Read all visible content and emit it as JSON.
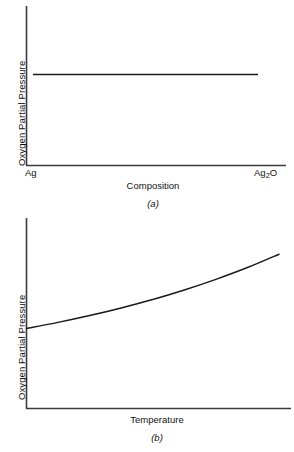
{
  "figure": {
    "panels": [
      {
        "id": "a",
        "caption": "(a)",
        "ylabel": "Oxygen Partial Pressure",
        "xlabel": "Composition",
        "xtick_left": "Ag",
        "xtick_right_main": "Ag",
        "xtick_right_sub": "2",
        "xtick_right_tail": "O"
      },
      {
        "id": "b",
        "caption": "(b)",
        "ylabel": "Oxygen Partial Pressure",
        "xlabel": "Temperature",
        "xtick_left": "",
        "xtick_right_main": "",
        "xtick_right_sub": "",
        "xtick_right_tail": ""
      }
    ]
  },
  "chart_data": [
    {
      "type": "line",
      "panel": "a",
      "title": "",
      "xlabel": "Composition",
      "ylabel": "Oxygen Partial Pressure",
      "xtick_labels": [
        "Ag",
        "Ag2O"
      ],
      "ytick_labels": [],
      "grid": false,
      "legend": "none",
      "xlim": [
        0,
        1
      ],
      "ylim": [
        0,
        1
      ],
      "x": [
        0.03,
        0.15,
        0.3,
        0.45,
        0.6,
        0.75,
        0.9,
        1.0
      ],
      "y": [
        0.575,
        0.575,
        0.575,
        0.575,
        0.575,
        0.575,
        0.575,
        0.575
      ],
      "series": [
        {
          "name": "Oxygen partial pressure vs composition",
          "x": [
            0.03,
            0.15,
            0.3,
            0.45,
            0.6,
            0.75,
            0.9,
            1.0
          ],
          "values": [
            0.575,
            0.575,
            0.575,
            0.575,
            0.575,
            0.575,
            0.575,
            0.575
          ]
        }
      ],
      "note": "Horizontal line: oxygen partial pressure is invariant across the Ag to Ag2O two-phase composition range"
    },
    {
      "type": "line",
      "panel": "b",
      "title": "",
      "xlabel": "Temperature",
      "ylabel": "Oxygen Partial Pressure",
      "xtick_labels": [],
      "ytick_labels": [],
      "grid": false,
      "legend": "none",
      "xlim": [
        0,
        1
      ],
      "ylim": [
        0,
        1
      ],
      "x": [
        0.0,
        0.125,
        0.25,
        0.375,
        0.5,
        0.625,
        0.75,
        0.875,
        1.0
      ],
      "y": [
        0.42,
        0.452,
        0.488,
        0.528,
        0.572,
        0.622,
        0.678,
        0.74,
        0.81
      ],
      "series": [
        {
          "name": "Oxygen partial pressure vs temperature",
          "x": [
            0.0,
            0.125,
            0.25,
            0.375,
            0.5,
            0.625,
            0.75,
            0.875,
            1.0
          ],
          "values": [
            0.42,
            0.452,
            0.488,
            0.528,
            0.572,
            0.622,
            0.678,
            0.74,
            0.81
          ]
        }
      ],
      "note": "Monotonically increasing, concave-up curve of oxygen partial pressure with temperature"
    }
  ],
  "style": {
    "background": "#ffffff",
    "axis_color": "#3a3a3a",
    "curve_color": "#1a1a1a",
    "text_color": "#111111"
  }
}
